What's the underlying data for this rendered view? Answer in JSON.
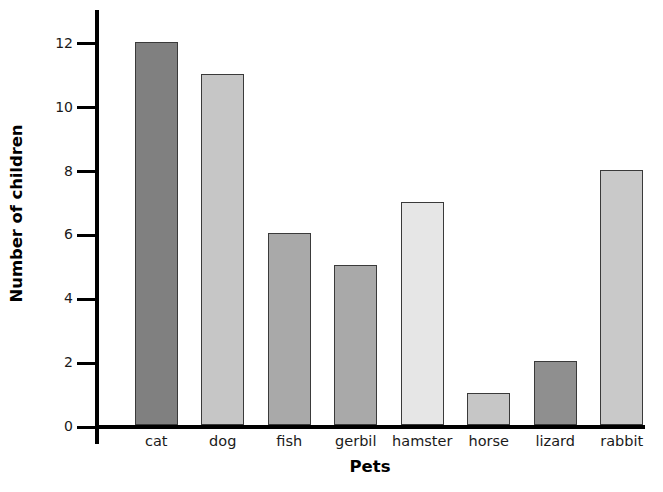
{
  "chart_data": {
    "type": "bar",
    "title": "",
    "xlabel": "Pets",
    "ylabel": "Number of children",
    "categories": [
      "cat",
      "dog",
      "fish",
      "gerbil",
      "hamster",
      "horse",
      "lizard",
      "rabbit"
    ],
    "values": [
      12,
      11,
      6,
      5,
      7,
      1,
      2,
      8
    ],
    "bar_colors": [
      "#808080",
      "#c6c6c6",
      "#a9a9a9",
      "#a9a9a9",
      "#e6e6e6",
      "#c6c6c6",
      "#8f8f8f",
      "#c9c9c9"
    ],
    "bar_edge_color": "#3a3a3a",
    "ylim": [
      0,
      13
    ],
    "ytick_labels": [
      "0",
      "2",
      "4",
      "6",
      "8",
      "10",
      "12"
    ],
    "ytick_values": [
      0,
      2,
      4,
      6,
      8,
      10,
      12
    ],
    "grid": false,
    "legend": "none",
    "axis_color": "#000000",
    "background": "#ffffff"
  }
}
